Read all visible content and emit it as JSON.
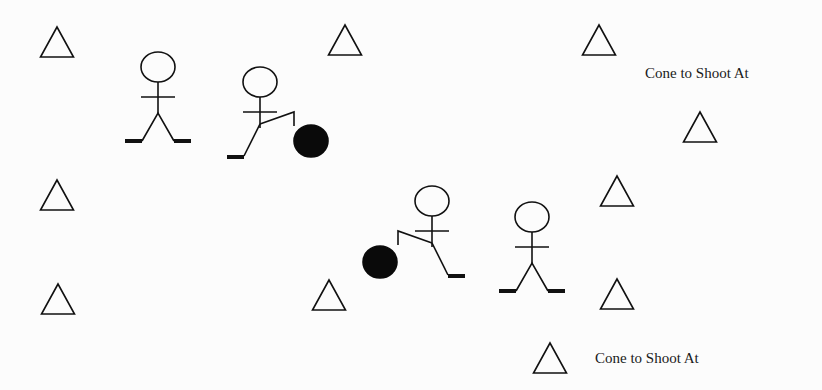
{
  "diagram": {
    "labels": [
      {
        "id": "label-top",
        "text": "Cone to Shoot At",
        "x": 645,
        "y": 65
      },
      {
        "id": "label-bottom",
        "text": "Cone to Shoot At",
        "x": 595,
        "y": 350
      }
    ],
    "cones": [
      {
        "x": 57,
        "y": 27
      },
      {
        "x": 345,
        "y": 25
      },
      {
        "x": 599,
        "y": 25
      },
      {
        "x": 700,
        "y": 112
      },
      {
        "x": 57,
        "y": 180
      },
      {
        "x": 617,
        "y": 176
      },
      {
        "x": 329,
        "y": 280
      },
      {
        "x": 58,
        "y": 284
      },
      {
        "x": 617,
        "y": 279
      },
      {
        "x": 550,
        "y": 343
      }
    ],
    "players": [
      {
        "role": "receiver",
        "x": 158,
        "y": 67
      },
      {
        "role": "kicker",
        "x": 260,
        "y": 82,
        "ball": {
          "x": 311,
          "y": 141
        }
      },
      {
        "role": "kicker",
        "x": 432,
        "y": 201,
        "ball": {
          "x": 380,
          "y": 262
        }
      },
      {
        "role": "receiver",
        "x": 532,
        "y": 217
      }
    ],
    "colors": {
      "line": "#111111",
      "ball": "#0a0a0a",
      "background": "#fcfcfc"
    }
  }
}
